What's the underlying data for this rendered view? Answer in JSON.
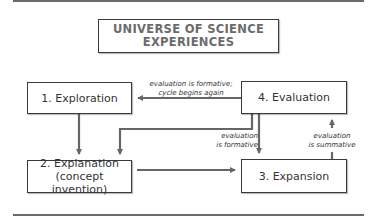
{
  "title": "UNIVERSE OF SCIENCE\nEXPERIENCES",
  "stages": [
    {
      "id": "exploration",
      "label": "1. Exploration"
    },
    {
      "id": "explanation",
      "label": "2. Explanation\n(concept invention)"
    },
    {
      "id": "expansion",
      "label": "3. Expansion"
    },
    {
      "id": "evaluation",
      "label": "4. Evaluation"
    }
  ],
  "edge_labels": {
    "evaluation_to_exploration": "evaluation is formative;\ncycle begins again",
    "evaluation_to_expansion": "evaluation\nis formative",
    "expansion_to_evaluation": "evaluation\nis summative"
  },
  "colors": {
    "line": "#666666",
    "box_border": "#3a3a3a",
    "title_text": "#6b6b6b"
  }
}
